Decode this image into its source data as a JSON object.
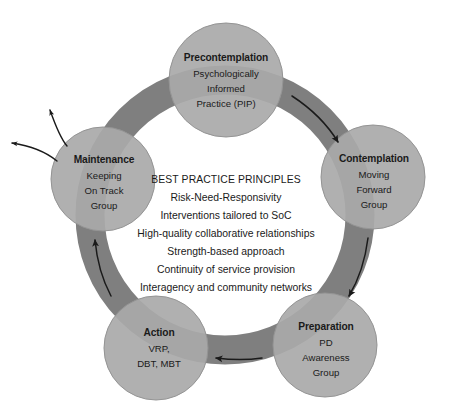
{
  "diagram": {
    "colors": {
      "ring": "#7f7f7f",
      "node_fill": "#a9a9a9",
      "node_stroke": "#8f8f8f",
      "arrow": "#1a1a1a",
      "text": "#1a1a1a",
      "background": "#ffffff"
    },
    "center": {
      "heading": "BEST PRACTICE PRINCIPLES",
      "lines": [
        "Risk-Need-Responsivity",
        "Interventions tailored to SoC",
        "High-quality collaborative relationships",
        "Strength-based approach",
        "Continuity of service provision",
        "Interagency and community networks"
      ]
    },
    "nodes": [
      {
        "id": "precontemplation",
        "title": "Precontemplation",
        "sub": [
          "Psychologically",
          "Informed",
          "Practice (PIP)"
        ]
      },
      {
        "id": "contemplation",
        "title": "Contemplation",
        "sub": [
          "Moving",
          "Forward",
          "Group"
        ]
      },
      {
        "id": "preparation",
        "title": "Preparation",
        "sub": [
          "PD",
          "Awareness",
          "Group"
        ]
      },
      {
        "id": "action",
        "title": "Action",
        "sub": [
          "VRP,",
          "DBT, MBT"
        ]
      },
      {
        "id": "maintenance",
        "title": "Maintenance",
        "sub": [
          "Keeping",
          "On Track",
          "Group"
        ]
      }
    ],
    "flow_arrows": [
      {
        "id": "precontemplation-to-contemplation",
        "direction": "clockwise"
      },
      {
        "id": "contemplation-to-preparation",
        "direction": "clockwise"
      },
      {
        "id": "preparation-to-action",
        "direction": "clockwise"
      },
      {
        "id": "action-to-maintenance",
        "direction": "clockwise"
      }
    ],
    "exit_arrows": [
      {
        "id": "exit-arrow-upper"
      },
      {
        "id": "exit-arrow-lower"
      }
    ]
  }
}
